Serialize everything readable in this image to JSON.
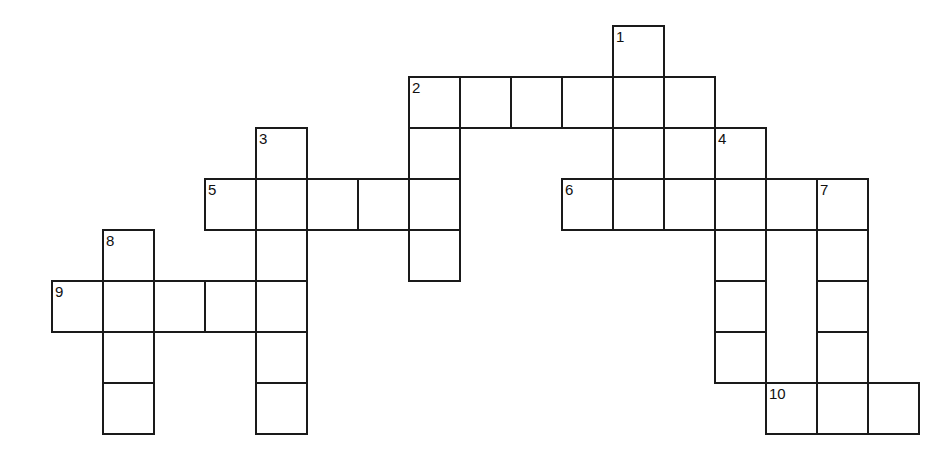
{
  "puzzle": {
    "title": "Crossword Puzzle Grid",
    "type": "crossword-grid",
    "background_color": "#ffffff",
    "cell_fill_color": "#ffffff",
    "line_color": "#1a1a1a",
    "number_color": "#111111",
    "cell_size_px": 51,
    "origin_x_px": 51,
    "origin_y_px": 25,
    "columns": 17,
    "rows": 9,
    "total_cells": 45,
    "numbered_clue_count": 10
  },
  "clue_numbers": [
    {
      "number": "1",
      "col": 11,
      "row": 0
    },
    {
      "number": "2",
      "col": 7,
      "row": 1
    },
    {
      "number": "3",
      "col": 4,
      "row": 2
    },
    {
      "number": "4",
      "col": 13,
      "row": 2
    },
    {
      "number": "5",
      "col": 3,
      "row": 3
    },
    {
      "number": "6",
      "col": 10,
      "row": 3
    },
    {
      "number": "7",
      "col": 15,
      "row": 3
    },
    {
      "number": "8",
      "col": 1,
      "row": 4
    },
    {
      "number": "9",
      "col": 0,
      "row": 5
    },
    {
      "number": "10",
      "col": 14,
      "row": 7
    }
  ],
  "entries": [
    {
      "number": "1",
      "direction": "down",
      "col": 11,
      "row": 0,
      "length": 4
    },
    {
      "number": "2",
      "direction": "across",
      "col": 7,
      "row": 1,
      "length": 6
    },
    {
      "number": "2",
      "direction": "down",
      "col": 7,
      "row": 1,
      "length": 4
    },
    {
      "number": "3",
      "direction": "down",
      "col": 4,
      "row": 2,
      "length": 6
    },
    {
      "number": "4",
      "direction": "down",
      "col": 13,
      "row": 2,
      "length": 5
    },
    {
      "number": "5",
      "direction": "across",
      "col": 3,
      "row": 3,
      "length": 5
    },
    {
      "number": "6",
      "direction": "across",
      "col": 10,
      "row": 3,
      "length": 6
    },
    {
      "number": "7",
      "direction": "down",
      "col": 15,
      "row": 3,
      "length": 5
    },
    {
      "number": "8",
      "direction": "down",
      "col": 1,
      "row": 4,
      "length": 4
    },
    {
      "number": "9",
      "direction": "across",
      "col": 0,
      "row": 5,
      "length": 5
    },
    {
      "number": "10",
      "direction": "across",
      "col": 14,
      "row": 7,
      "length": 3
    }
  ],
  "cells": [
    {
      "col": 11,
      "row": 0
    },
    {
      "col": 7,
      "row": 1
    },
    {
      "col": 8,
      "row": 1
    },
    {
      "col": 9,
      "row": 1
    },
    {
      "col": 10,
      "row": 1
    },
    {
      "col": 11,
      "row": 1
    },
    {
      "col": 12,
      "row": 1
    },
    {
      "col": 4,
      "row": 2
    },
    {
      "col": 7,
      "row": 2
    },
    {
      "col": 11,
      "row": 2
    },
    {
      "col": 12,
      "row": 2
    },
    {
      "col": 13,
      "row": 2
    },
    {
      "col": 3,
      "row": 3
    },
    {
      "col": 4,
      "row": 3
    },
    {
      "col": 5,
      "row": 3
    },
    {
      "col": 6,
      "row": 3
    },
    {
      "col": 7,
      "row": 3
    },
    {
      "col": 10,
      "row": 3
    },
    {
      "col": 11,
      "row": 3
    },
    {
      "col": 12,
      "row": 3
    },
    {
      "col": 13,
      "row": 3
    },
    {
      "col": 14,
      "row": 3
    },
    {
      "col": 15,
      "row": 3
    },
    {
      "col": 1,
      "row": 4
    },
    {
      "col": 4,
      "row": 4
    },
    {
      "col": 7,
      "row": 4
    },
    {
      "col": 13,
      "row": 4
    },
    {
      "col": 15,
      "row": 4
    },
    {
      "col": 0,
      "row": 5
    },
    {
      "col": 1,
      "row": 5
    },
    {
      "col": 2,
      "row": 5
    },
    {
      "col": 3,
      "row": 5
    },
    {
      "col": 4,
      "row": 5
    },
    {
      "col": 13,
      "row": 5
    },
    {
      "col": 15,
      "row": 5
    },
    {
      "col": 1,
      "row": 6
    },
    {
      "col": 4,
      "row": 6
    },
    {
      "col": 13,
      "row": 6
    },
    {
      "col": 15,
      "row": 6
    },
    {
      "col": 1,
      "row": 7
    },
    {
      "col": 4,
      "row": 7
    },
    {
      "col": 14,
      "row": 7
    },
    {
      "col": 15,
      "row": 7
    },
    {
      "col": 16,
      "row": 7
    }
  ]
}
